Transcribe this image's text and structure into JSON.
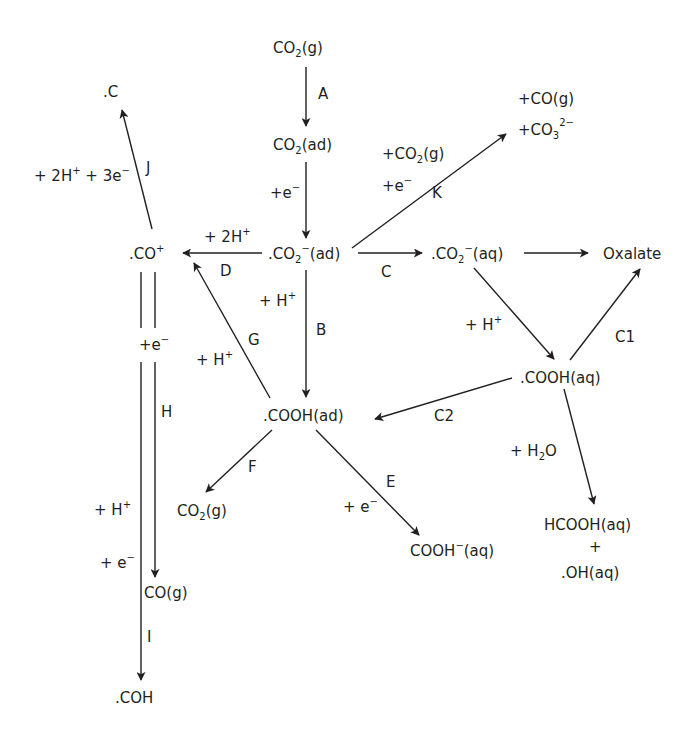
{
  "diagram": {
    "colors": {
      "ink": "#231f20",
      "background": "#ffffff"
    },
    "nodes": {
      "co2_g_top": {
        "main": "CO",
        "sub": "2",
        "tail": "(g)"
      },
      "co2_ad": {
        "main": "CO",
        "sub": "2",
        "tail": "(ad)"
      },
      "co2m_ad": {
        "main": ".CO",
        "sub": "2",
        "sup": "−",
        "tail": "(ad)"
      },
      "co2m_aq": {
        "main": ".CO",
        "sub": "2",
        "sup": "−",
        "tail": "(aq)"
      },
      "oxalate": {
        "main": "Oxalate"
      },
      "k_prod_co": {
        "main": "+CO(g)"
      },
      "k_prod_co3": {
        "main": "+CO",
        "sub": "3",
        "sup": "2−"
      },
      "co_plus": {
        "main": ".CO",
        "sup": "+"
      },
      "c_dot": {
        "main": ".C"
      },
      "cooh_ad": {
        "main": ".COOH(ad)"
      },
      "cooh_aq": {
        "main": ".COOH(aq)"
      },
      "co2_g_f": {
        "main": "CO",
        "sub": "2",
        "tail": "(g)"
      },
      "cooh_m_aq": {
        "main": "COOH",
        "sup": "−",
        "tail": "(aq)"
      },
      "hcooh_aq": {
        "main": "HCOOH(aq)"
      },
      "plus_sign": {
        "main": "+"
      },
      "oh_aq": {
        "main": ".OH(aq)"
      },
      "co_g": {
        "main": "CO(g)"
      },
      "coh": {
        "main": ".COH"
      }
    },
    "edge_labels": {
      "A": "A",
      "B": "B",
      "C": "C",
      "C1": "C1",
      "C2": "C2",
      "D": "D",
      "E": "E",
      "F": "F",
      "G": "G",
      "H": "H",
      "I": "I",
      "J": "J",
      "K": "K"
    },
    "reagents": {
      "e_after_A": {
        "main": "+e",
        "sup": "−"
      },
      "k_co2": {
        "main": "+CO",
        "sub": "2",
        "tail": "(g)"
      },
      "k_e": {
        "main": "+e",
        "sup": "−"
      },
      "j": {
        "main": "+ 2H",
        "sup": "+",
        "mid": " + 3e",
        "sup2": "−"
      },
      "d": {
        "main": "+ 2H",
        "sup": "+"
      },
      "b": {
        "main": "+ H",
        "sup": "+"
      },
      "g": {
        "main": "+ H",
        "sup": "+"
      },
      "c_h": {
        "main": "+ H",
        "sup": "+"
      },
      "h_e": {
        "main": "+e",
        "sup": "−"
      },
      "i_h": {
        "main": "+ H",
        "sup": "+"
      },
      "i_e": {
        "main": "+ e",
        "sup": "−"
      },
      "e_e": {
        "main": "+ e",
        "sup": "−"
      },
      "c2_h2o": {
        "main": "+ H",
        "sub": "2",
        "tail": "O"
      }
    }
  }
}
